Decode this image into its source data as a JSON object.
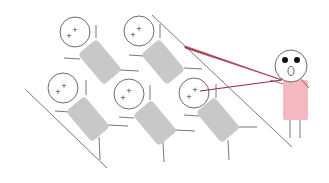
{
  "scene": {
    "title": "Classroom illustration: teacher pointing at students",
    "colors": {
      "background": "#ffffff",
      "outline": "#555555",
      "desk": "#c8c8c8",
      "teacher_body": "#f4b8c0",
      "pointer": "#a3263f",
      "eyes": "#111111"
    },
    "students": [
      {
        "id": "student-1",
        "head": {
          "cx": 75,
          "cy": 32,
          "r": 15
        },
        "desk": {
          "cx": 100,
          "cy": 62,
          "w": 24,
          "h": 40,
          "angle": -40
        }
      },
      {
        "id": "student-2",
        "head": {
          "cx": 139,
          "cy": 31,
          "r": 15
        },
        "desk": {
          "cx": 163,
          "cy": 62,
          "w": 24,
          "h": 40,
          "angle": -40
        }
      },
      {
        "id": "student-3",
        "head": {
          "cx": 63,
          "cy": 88,
          "r": 15
        },
        "desk": {
          "cx": 88,
          "cy": 119,
          "w": 24,
          "h": 40,
          "angle": -40
        }
      },
      {
        "id": "student-4",
        "head": {
          "cx": 129,
          "cy": 94,
          "r": 15
        },
        "desk": {
          "cx": 155,
          "cy": 123,
          "w": 24,
          "h": 40,
          "angle": -40
        }
      },
      {
        "id": "student-5",
        "head": {
          "cx": 194,
          "cy": 93,
          "r": 15
        },
        "desk": {
          "cx": 218,
          "cy": 120,
          "w": 24,
          "h": 40,
          "angle": -40
        }
      }
    ],
    "teacher": {
      "head": {
        "cx": 291,
        "cy": 67,
        "r": 16
      },
      "body": {
        "x": 283,
        "y": 80,
        "w": 25,
        "h": 40
      },
      "expression": "shocked"
    },
    "pointers": [
      {
        "from": [
          185,
          47
        ],
        "to": [
          282,
          80
        ]
      },
      {
        "from": [
          200,
          91
        ],
        "to": [
          282,
          80
        ]
      }
    ],
    "guide_lines": [
      {
        "from": [
          26,
          90
        ],
        "to": [
          107,
          168
        ]
      },
      {
        "from": [
          152,
          15
        ],
        "to": [
          292,
          147
        ]
      }
    ]
  }
}
